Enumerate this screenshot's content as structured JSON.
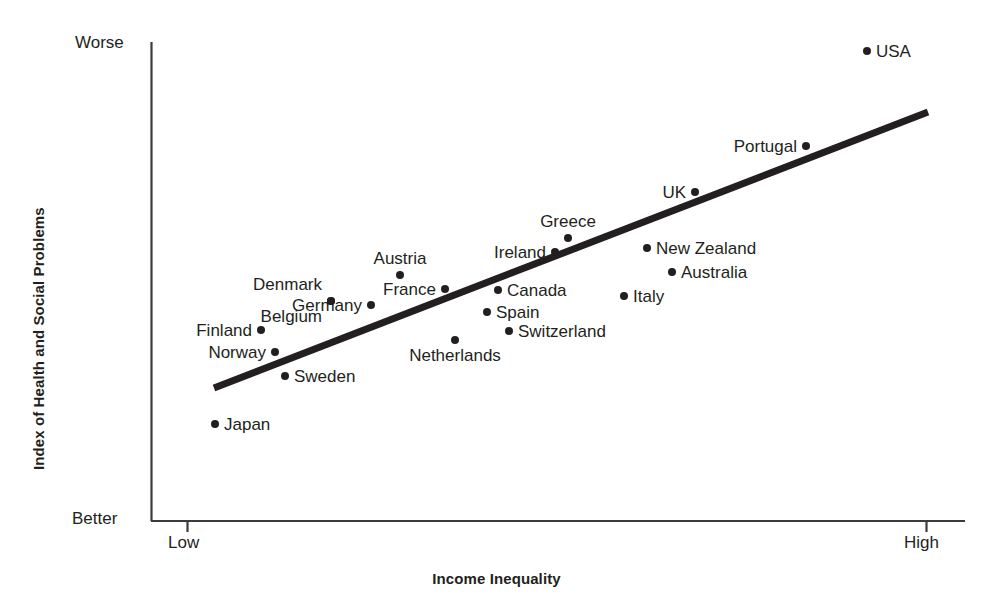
{
  "chart_data": {
    "type": "scatter",
    "title": "",
    "xlabel": "Income Inequality",
    "ylabel": "Index of Health and Social Problems",
    "x_tick_labels": [
      "Low",
      "High"
    ],
    "y_tick_labels": [
      "Worse",
      "Better"
    ],
    "xlim": [
      "Low",
      "High"
    ],
    "ylim": [
      "Better",
      "Worse"
    ],
    "grid": false,
    "legend": "none",
    "axis_note": "Qualitative axes: x runs Low to High income inequality, y runs Better (bottom) to Worse (top)",
    "point_color": "#231f20",
    "trendline": {
      "present": true,
      "color": "#231f20",
      "width_px": 7,
      "x_start_px": 214,
      "y_start_px": 388,
      "x_end_px": 928,
      "y_end_px": 112,
      "description": "Positive-slope regression line through the country points"
    },
    "points": [
      {
        "name": "Japan",
        "px": 215,
        "py": 424,
        "label_pos": "right",
        "x_rel": 0.037,
        "y_rel": 0.202
      },
      {
        "name": "Finland",
        "px": 261,
        "py": 330,
        "label_pos": "left",
        "x_rel": 0.096,
        "y_rel": 0.398
      },
      {
        "name": "Norway",
        "px": 275,
        "py": 352,
        "label_pos": "left",
        "x_rel": 0.114,
        "y_rel": 0.352
      },
      {
        "name": "Sweden",
        "px": 285,
        "py": 376,
        "label_pos": "right",
        "x_rel": 0.127,
        "y_rel": 0.302
      },
      {
        "name": "Denmark",
        "px": 331,
        "py": 301,
        "label_pos": "upper-left",
        "x_rel": 0.189,
        "y_rel": 0.458
      },
      {
        "name": "Belgium",
        "px": 331,
        "py": 301,
        "label_pos": "lower-left",
        "x_rel": 0.189,
        "y_rel": 0.458
      },
      {
        "name": "Germany",
        "px": 371,
        "py": 305,
        "label_pos": "left",
        "x_rel": 0.243,
        "y_rel": 0.45
      },
      {
        "name": "Austria",
        "px": 400,
        "py": 275,
        "label_pos": "above",
        "x_rel": 0.282,
        "y_rel": 0.512
      },
      {
        "name": "France",
        "px": 445,
        "py": 289,
        "label_pos": "left",
        "x_rel": 0.342,
        "y_rel": 0.483
      },
      {
        "name": "Netherlands",
        "px": 455,
        "py": 340,
        "label_pos": "below",
        "x_rel": 0.356,
        "y_rel": 0.377
      },
      {
        "name": "Spain",
        "px": 487,
        "py": 312,
        "label_pos": "right",
        "x_rel": 0.399,
        "y_rel": 0.435
      },
      {
        "name": "Canada",
        "px": 498,
        "py": 290,
        "label_pos": "right",
        "x_rel": 0.414,
        "y_rel": 0.481
      },
      {
        "name": "Switzerland",
        "px": 509,
        "py": 331,
        "label_pos": "right",
        "x_rel": 0.429,
        "y_rel": 0.396
      },
      {
        "name": "Ireland",
        "px": 555,
        "py": 252,
        "label_pos": "left",
        "x_rel": 0.491,
        "y_rel": 0.56
      },
      {
        "name": "Greece",
        "px": 568,
        "py": 238,
        "label_pos": "above",
        "x_rel": 0.508,
        "y_rel": 0.59
      },
      {
        "name": "Italy",
        "px": 624,
        "py": 296,
        "label_pos": "right",
        "x_rel": 0.584,
        "y_rel": 0.469
      },
      {
        "name": "New Zealand",
        "px": 647,
        "py": 248,
        "label_pos": "right",
        "x_rel": 0.615,
        "y_rel": 0.569
      },
      {
        "name": "Australia",
        "px": 672,
        "py": 272,
        "label_pos": "right",
        "x_rel": 0.649,
        "y_rel": 0.519
      },
      {
        "name": "UK",
        "px": 695,
        "py": 192,
        "label_pos": "left",
        "x_rel": 0.679,
        "y_rel": 0.685
      },
      {
        "name": "Portugal",
        "px": 806,
        "py": 146,
        "label_pos": "left",
        "x_rel": 0.83,
        "y_rel": 0.781
      },
      {
        "name": "USA",
        "px": 867,
        "py": 51,
        "label_pos": "right",
        "x_rel": 0.912,
        "y_rel": 0.98
      }
    ]
  },
  "axes": {
    "x_title": "Income Inequality",
    "y_title": "Index of Health and Social Problems",
    "y_top_label": "Worse",
    "y_bottom_label": "Better",
    "x_left_label": "Low",
    "x_right_label": "High"
  }
}
